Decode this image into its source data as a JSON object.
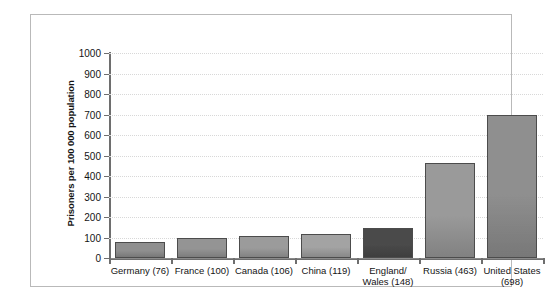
{
  "chart_data": {
    "type": "bar",
    "title": "",
    "xlabel": "",
    "ylabel": "Prisoners per 100 000 population",
    "ylim": [
      0,
      1000
    ],
    "yticks": [
      0,
      100,
      200,
      300,
      400,
      500,
      600,
      700,
      800,
      900,
      1000
    ],
    "ytick_labels": [
      "0",
      "100",
      "200",
      "300",
      "400",
      "500",
      "600",
      "700",
      "800",
      "900",
      "1000"
    ],
    "grid": true,
    "legend": "none",
    "categories": [
      "Germany (76)",
      "France (100)",
      "Canada (106)",
      "China (119)",
      "England/ Wales (148)",
      "Russia (463)",
      "United States (698)"
    ],
    "category_lines": [
      [
        "Germany (76)"
      ],
      [
        "France (100)"
      ],
      [
        "Canada (106)"
      ],
      [
        "China (119)"
      ],
      [
        "England/",
        "Wales (148)"
      ],
      [
        "Russia (463)"
      ],
      [
        "United States",
        "(698)"
      ]
    ],
    "values": [
      76,
      100,
      106,
      119,
      148,
      463,
      698
    ],
    "bar_colors": [
      "#8f8f8f",
      "#949494",
      "#9b9b9b",
      "#a3a3a3",
      "#4a4a4a",
      "#9a9a9a",
      "#8f8f8f"
    ],
    "bar_edge_color": "#4c4c4c",
    "gridline_color": "#d8d8d8",
    "axis_color": "#6e6e6e",
    "frame_color": "#b9b9b9",
    "background": "#ffffff"
  }
}
